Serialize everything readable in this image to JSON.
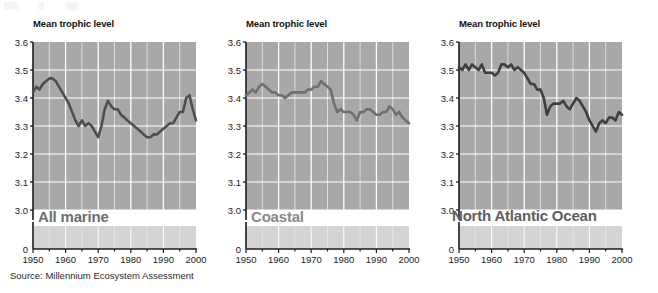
{
  "figure": {
    "source_note": "Source: Millennium Ecosystem Assessment",
    "axis_title": "Mean trophic level",
    "panel_bg": "#a8a8a8",
    "panel_bg_lower": "#d4d4d4",
    "grid_color": "#ffffff",
    "line_color_dark": "#545454",
    "line_color_mid": "#7d7d7d",
    "caption_color": "#6e6e6e"
  },
  "panels": [
    {
      "title": "Mean trophic level",
      "caption": "All marine",
      "caption_color": "#6e6e6e",
      "line_color": "#4f4f4f"
    },
    {
      "title": "Mean trophic level",
      "caption": "Coastal",
      "caption_color": "#8a8a8a",
      "line_color": "#6f6f6f"
    },
    {
      "title": "Mean trophic level",
      "caption": "North Atlantic Ocean",
      "caption_color": "#5e5e5e",
      "line_color": "#3f3f3f"
    }
  ],
  "axes": {
    "ylabels": [
      "3.6",
      "3.5",
      "3.4",
      "3.3",
      "3.2",
      "3.1",
      "3.0",
      "0"
    ],
    "yvalues": [
      3.6,
      3.5,
      3.4,
      3.3,
      3.2,
      3.1,
      3.0
    ],
    "zero_label": "0",
    "xlabels": [
      "1950",
      "1960",
      "1970",
      "1980",
      "1990",
      "2000"
    ],
    "xvalues": [
      1950,
      1960,
      1970,
      1980,
      1990,
      2000
    ],
    "ylim": [
      3.0,
      3.6
    ],
    "xlim": [
      1950,
      2000
    ],
    "broken_axis": true
  },
  "chart_data": [
    {
      "type": "line",
      "title": "All marine",
      "ylabel": "Mean trophic level",
      "xlabel": "",
      "ylim": [
        3.0,
        3.6
      ],
      "xlim": [
        1950,
        2000
      ],
      "grid": true,
      "legend": "none",
      "broken_y_axis_at_zero": true,
      "x": [
        1950,
        1951,
        1952,
        1953,
        1954,
        1955,
        1956,
        1957,
        1958,
        1959,
        1960,
        1961,
        1962,
        1963,
        1964,
        1965,
        1966,
        1967,
        1968,
        1969,
        1970,
        1971,
        1972,
        1973,
        1974,
        1975,
        1976,
        1977,
        1978,
        1979,
        1980,
        1981,
        1982,
        1983,
        1984,
        1985,
        1986,
        1987,
        1988,
        1989,
        1990,
        1991,
        1992,
        1993,
        1994,
        1995,
        1996,
        1997,
        1998,
        1999,
        2000
      ],
      "values": [
        3.42,
        3.44,
        3.43,
        3.45,
        3.46,
        3.47,
        3.47,
        3.46,
        3.44,
        3.42,
        3.4,
        3.38,
        3.35,
        3.32,
        3.3,
        3.32,
        3.3,
        3.31,
        3.3,
        3.28,
        3.26,
        3.3,
        3.36,
        3.39,
        3.37,
        3.36,
        3.36,
        3.34,
        3.33,
        3.32,
        3.31,
        3.3,
        3.29,
        3.28,
        3.27,
        3.26,
        3.26,
        3.27,
        3.27,
        3.28,
        3.29,
        3.3,
        3.31,
        3.31,
        3.33,
        3.35,
        3.35,
        3.4,
        3.41,
        3.36,
        3.32
      ]
    },
    {
      "type": "line",
      "title": "Coastal",
      "ylabel": "Mean trophic level",
      "xlabel": "",
      "ylim": [
        3.0,
        3.6
      ],
      "xlim": [
        1950,
        2000
      ],
      "grid": true,
      "legend": "none",
      "broken_y_axis_at_zero": true,
      "x": [
        1950,
        1951,
        1952,
        1953,
        1954,
        1955,
        1956,
        1957,
        1958,
        1959,
        1960,
        1961,
        1962,
        1963,
        1964,
        1965,
        1966,
        1967,
        1968,
        1969,
        1970,
        1971,
        1972,
        1973,
        1974,
        1975,
        1976,
        1977,
        1978,
        1979,
        1980,
        1981,
        1982,
        1983,
        1984,
        1985,
        1986,
        1987,
        1988,
        1989,
        1990,
        1991,
        1992,
        1993,
        1994,
        1995,
        1996,
        1997,
        1998,
        1999,
        2000
      ],
      "values": [
        3.41,
        3.42,
        3.43,
        3.42,
        3.44,
        3.45,
        3.44,
        3.43,
        3.42,
        3.42,
        3.41,
        3.41,
        3.4,
        3.41,
        3.42,
        3.42,
        3.42,
        3.42,
        3.42,
        3.43,
        3.43,
        3.44,
        3.44,
        3.46,
        3.45,
        3.44,
        3.43,
        3.38,
        3.35,
        3.36,
        3.35,
        3.35,
        3.35,
        3.34,
        3.32,
        3.35,
        3.35,
        3.36,
        3.36,
        3.35,
        3.34,
        3.34,
        3.35,
        3.35,
        3.37,
        3.36,
        3.34,
        3.35,
        3.33,
        3.32,
        3.31
      ]
    },
    {
      "type": "line",
      "title": "North Atlantic Ocean",
      "ylabel": "Mean trophic level",
      "xlabel": "",
      "ylim": [
        3.0,
        3.6
      ],
      "xlim": [
        1950,
        2000
      ],
      "grid": true,
      "legend": "none",
      "broken_y_axis_at_zero": true,
      "x": [
        1950,
        1951,
        1952,
        1953,
        1954,
        1955,
        1956,
        1957,
        1958,
        1959,
        1960,
        1961,
        1962,
        1963,
        1964,
        1965,
        1966,
        1967,
        1968,
        1969,
        1970,
        1971,
        1972,
        1973,
        1974,
        1975,
        1976,
        1977,
        1978,
        1979,
        1980,
        1981,
        1982,
        1983,
        1984,
        1985,
        1986,
        1987,
        1988,
        1989,
        1990,
        1991,
        1992,
        1993,
        1994,
        1995,
        1996,
        1997,
        1998,
        1999,
        2000
      ],
      "values": [
        3.51,
        3.5,
        3.52,
        3.5,
        3.52,
        3.51,
        3.5,
        3.52,
        3.49,
        3.49,
        3.49,
        3.48,
        3.49,
        3.52,
        3.52,
        3.51,
        3.52,
        3.5,
        3.51,
        3.5,
        3.49,
        3.47,
        3.45,
        3.45,
        3.43,
        3.43,
        3.4,
        3.34,
        3.37,
        3.38,
        3.38,
        3.38,
        3.39,
        3.37,
        3.36,
        3.38,
        3.4,
        3.39,
        3.37,
        3.35,
        3.32,
        3.3,
        3.28,
        3.31,
        3.32,
        3.31,
        3.33,
        3.33,
        3.32,
        3.35,
        3.34
      ]
    }
  ]
}
